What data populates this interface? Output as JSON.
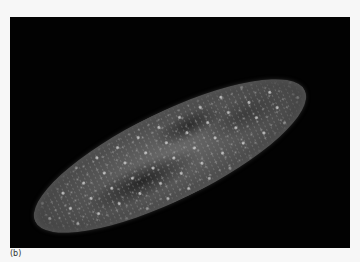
{
  "figure": {
    "caption_label": "(b)",
    "colors": {
      "background": "#020202",
      "page": "#f7f7f7",
      "cell": "#5a5a5a"
    }
  }
}
